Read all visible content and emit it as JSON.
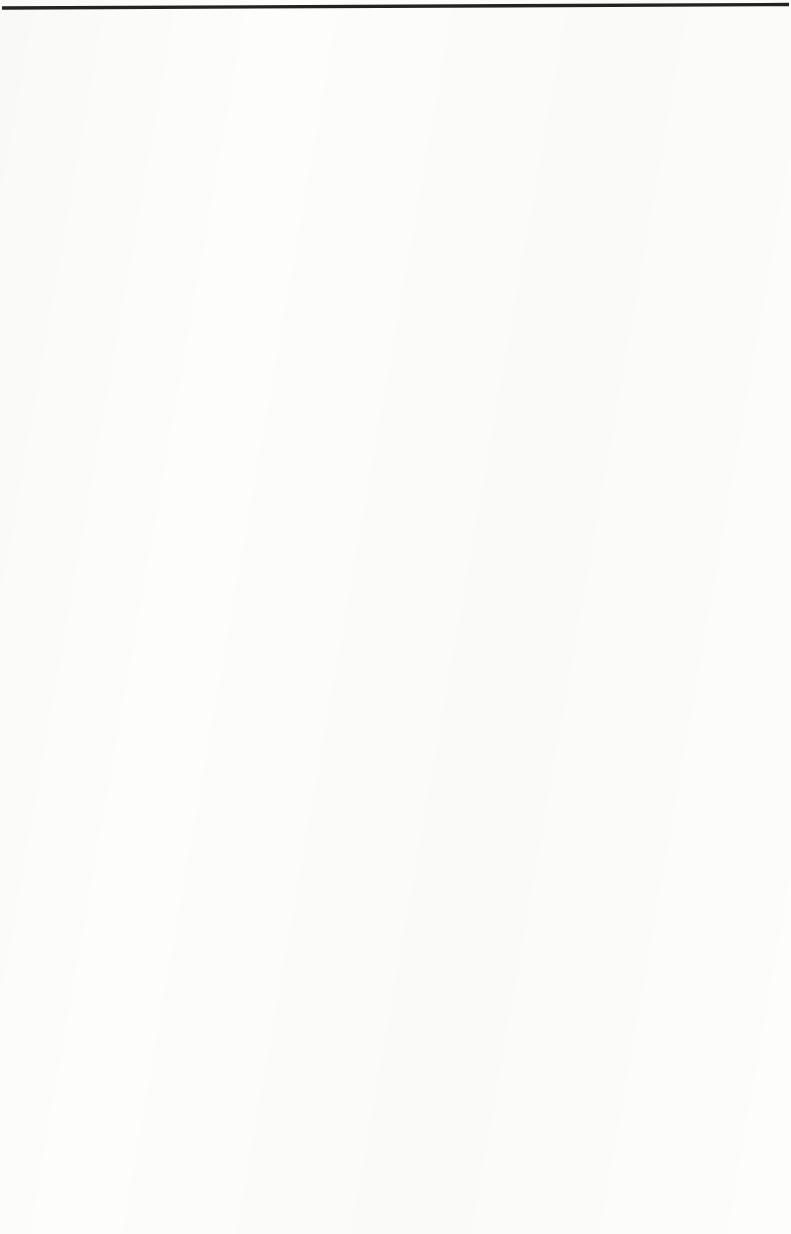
{
  "figure": {
    "kind": "scanned-book-figure",
    "top_rule": true,
    "hatch_color": "#1c1c1c",
    "band_border_color": "#2a2a2a",
    "background_color": "#fdfdfb",
    "reference_line_color": "#111111",
    "marker_dot_color": "#0d0d0d"
  },
  "chart_data": {
    "type": "area",
    "title": "",
    "subtitle": "",
    "xlabel": "",
    "ylabel": "",
    "grid": false,
    "legend": "none",
    "x": [
      0,
      0.1,
      0.2,
      0.3,
      0.4,
      0.5,
      0.6,
      0.7,
      0.8,
      0.9,
      1.0
    ],
    "xlim": [
      0,
      1
    ],
    "ylim": [
      0,
      1
    ],
    "annotations": [
      "vertical reference line at x = 0.845 crossing every band",
      "solid dot marker inside the hatched area of every band",
      "arrowheads on the reference line indicating direction of change"
    ],
    "series": [
      {
        "name": "Paper",
        "label": "Paper",
        "arrow_top": false,
        "arrow_bottom": true,
        "dot_y": 0.52,
        "values": [
          0.18,
          0.22,
          0.24,
          0.27,
          0.28,
          0.3,
          0.33,
          0.38,
          0.44,
          0.92,
          1.0
        ],
        "right_edge": 0.72
      },
      {
        "name": "Pharmaceuticals",
        "label": "Pharmaceuticals",
        "arrow_top": true,
        "arrow_bottom": true,
        "dot_y": 0.5,
        "values": [
          0.0,
          0.0,
          0.0,
          0.0,
          0.0,
          0.03,
          0.38,
          0.48,
          0.62,
          0.95,
          1.0
        ],
        "right_edge": 0.86
      },
      {
        "name": "Dentifrice",
        "label": "Dentifrice",
        "arrow_top": true,
        "arrow_bottom": true,
        "dot_y": 0.54,
        "values": [
          0.0,
          0.0,
          0.04,
          0.24,
          0.28,
          0.32,
          0.42,
          0.52,
          0.62,
          0.94,
          1.0
        ],
        "right_edge": 0.86
      },
      {
        "name": "Soaps",
        "label": "Soaps",
        "arrow_top": true,
        "arrow_bottom": false,
        "dot_y": 0.52,
        "values": [
          0.1,
          0.16,
          0.18,
          0.2,
          0.22,
          0.2,
          0.22,
          0.38,
          0.44,
          0.94,
          1.0
        ],
        "right_edge": 0.72
      },
      {
        "name": "Shortening and Oils",
        "label": "Shortening and Oils",
        "arrow_top": true,
        "arrow_bottom": true,
        "dot_y": 0.5,
        "values": [
          0.12,
          0.16,
          0.17,
          0.18,
          0.2,
          0.2,
          0.22,
          0.32,
          0.42,
          0.94,
          1.0
        ],
        "right_edge": 0.72
      },
      {
        "name": "Prepared Mixes",
        "label": "Prepared Mixes",
        "arrow_top": true,
        "arrow_bottom": false,
        "dot_y": 0.5,
        "values": [
          0.0,
          0.0,
          0.0,
          0.0,
          0.0,
          0.04,
          0.3,
          0.52,
          0.7,
          0.96,
          1.0
        ],
        "right_edge": 0.76
      },
      {
        "name": "Coffee",
        "label": "Coffee",
        "arrow_top": true,
        "arrow_bottom": false,
        "dot_y": 0.5,
        "values": [
          0.0,
          0.0,
          0.0,
          0.0,
          0.0,
          0.0,
          0.08,
          0.42,
          0.7,
          0.96,
          1.0
        ],
        "right_edge": 0.74
      },
      {
        "name": "Soft Drinks",
        "label": "Soft Drinks",
        "arrow_top": true,
        "arrow_bottom": false,
        "dot_y": 0.48,
        "values": [
          0.0,
          0.0,
          0.0,
          0.0,
          0.06,
          0.22,
          0.4,
          0.78,
          1.0,
          0.92,
          0.3
        ],
        "right_edge": 0.92
      }
    ]
  },
  "labels": {
    "paper": "Paper",
    "pharmaceuticals": "Pharmaceuticals",
    "dentifrice": "Dentifrice",
    "soaps": "Soaps",
    "shortening_and_oils": "Shortening and Oils",
    "prepared_mixes": "Prepared Mixes",
    "coffee": "Coffee",
    "soft_drinks": "Soft Drinks"
  }
}
